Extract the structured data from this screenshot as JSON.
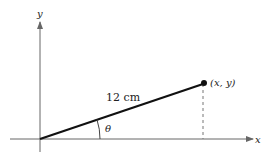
{
  "diagram": {
    "axes": {
      "x_label": "x",
      "y_label": "y"
    },
    "segment": {
      "length_label": "12 cm",
      "angle_label": "θ"
    },
    "point": {
      "label": "(x, y)"
    },
    "colors": {
      "stroke": "#111111",
      "axis": "#555555",
      "dashed": "#777777"
    }
  }
}
